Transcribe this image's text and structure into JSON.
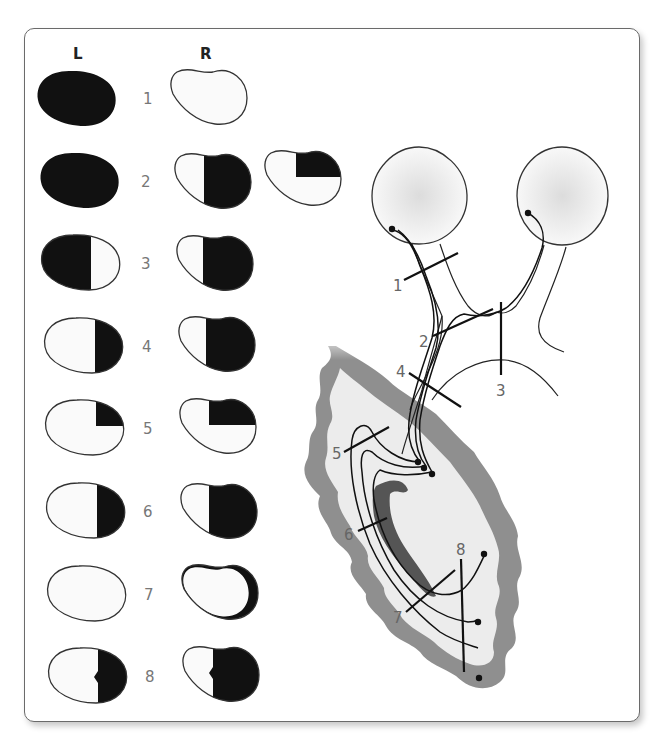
{
  "figure": {
    "column_headers": {
      "left": "L",
      "right": "R"
    },
    "rows": [
      {
        "number": "1",
        "left": "full",
        "right": "empty"
      },
      {
        "number": "2",
        "left": "full",
        "right": "right-half",
        "extra": "upper-right-quadrant"
      },
      {
        "number": "3",
        "left": "left-half",
        "right": "right-half"
      },
      {
        "number": "4",
        "left": "right-half",
        "right": "right-half"
      },
      {
        "number": "5",
        "left": "upper-right-quadrant",
        "right": "upper-right-quadrant"
      },
      {
        "number": "6",
        "left": "right-half",
        "right": "right-half"
      },
      {
        "number": "7",
        "left": "empty",
        "right": "right-crescent"
      },
      {
        "number": "8",
        "left": "right-half-macular-sparing",
        "right": "right-half-macular-sparing"
      }
    ],
    "pathway_labels": [
      "1",
      "2",
      "3",
      "4",
      "5",
      "6",
      "7",
      "8"
    ],
    "colors": {
      "defect": "#111111",
      "field": "#fafafa",
      "outline": "#333333",
      "cortex": "#8f8f8f",
      "white_matter": "#ececec",
      "ventricle": "#555555",
      "eye_fill": "#f3f3f3"
    }
  }
}
